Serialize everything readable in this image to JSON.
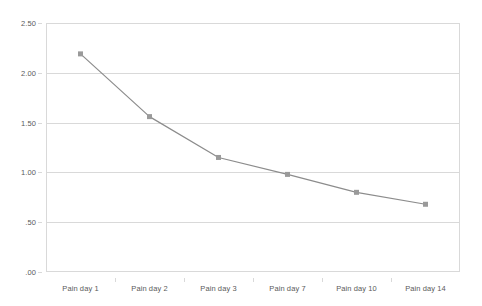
{
  "chart_data": {
    "type": "line",
    "title": "",
    "subtitle": "",
    "xlabel": "",
    "ylabel": "",
    "categories": [
      "Pain day 1",
      "Pain day 2",
      "Pain day 3",
      "Pain day 7",
      "Pain day 10",
      "Pain day 14"
    ],
    "series": [
      {
        "name": "Pain score",
        "values": [
          2.19,
          1.56,
          1.15,
          0.98,
          0.8,
          0.68
        ]
      }
    ],
    "ylim": [
      0.0,
      2.5
    ],
    "yticks": [
      2.5,
      2.0,
      1.5,
      1.0,
      0.5,
      0.0
    ],
    "ytick_labels": [
      "2.50",
      "2.00",
      "1.50",
      "1.00",
      ".50",
      ".00"
    ],
    "grid": "horizontal",
    "legend": "none",
    "colors": {
      "line": "#8c8c8c",
      "marker": "#9a9a9a",
      "gridline": "#d9d9d9",
      "axis_text": "#5a5a5a",
      "plot_border": "#d9d9d9",
      "background": "#ffffff"
    },
    "marker_shape": "square",
    "annotations": []
  }
}
